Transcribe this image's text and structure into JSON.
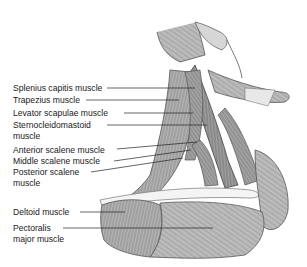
{
  "diagram": {
    "labels": [
      {
        "id": "splenius",
        "text": "Splenius capitis muscle",
        "x": 13,
        "y": 83,
        "line": {
          "x1": 107,
          "y1": 88,
          "x2": 195,
          "y2": 88
        }
      },
      {
        "id": "trapezius",
        "text": "Trapezius muscle",
        "x": 13,
        "y": 95,
        "line": {
          "x1": 86,
          "y1": 100,
          "x2": 179,
          "y2": 100
        }
      },
      {
        "id": "levator",
        "text": "Levator scapulae muscle",
        "x": 13,
        "y": 108,
        "line": {
          "x1": 124,
          "y1": 113,
          "x2": 193,
          "y2": 113
        }
      },
      {
        "id": "scm",
        "text": "Sternocleidomastoid",
        "text2": "muscle",
        "x": 13,
        "y": 120,
        "line": {
          "x1": 107,
          "y1": 125,
          "x2": 207,
          "y2": 125
        }
      },
      {
        "id": "anterior",
        "text": "Anterior scalene muscle",
        "x": 13,
        "y": 145,
        "line": {
          "x1": 117,
          "y1": 149,
          "x2": 197,
          "y2": 142
        }
      },
      {
        "id": "middle",
        "text": "Middle scalene muscle",
        "x": 13,
        "y": 156,
        "line": {
          "x1": 114,
          "y1": 161,
          "x2": 191,
          "y2": 150
        }
      },
      {
        "id": "posterior",
        "text": "Posterior scalene",
        "text2": "muscle",
        "x": 13,
        "y": 167,
        "line": {
          "x1": 91,
          "y1": 172,
          "x2": 183,
          "y2": 158
        }
      },
      {
        "id": "deltoid",
        "text": "Deltoid muscle",
        "x": 13,
        "y": 207,
        "line": {
          "x1": 80,
          "y1": 212,
          "x2": 125,
          "y2": 212
        }
      },
      {
        "id": "pectoralis",
        "text": "Pectoralis",
        "text2": "major muscle",
        "x": 13,
        "y": 223,
        "line": {
          "x1": 63,
          "y1": 228,
          "x2": 213,
          "y2": 228
        }
      }
    ]
  }
}
